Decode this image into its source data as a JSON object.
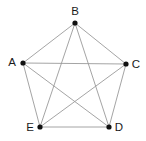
{
  "figure": {
    "type": "graph-diagram",
    "width": 146,
    "height": 141,
    "background_color": "#ffffff",
    "edge_color": "#9a9a9a",
    "vertex_color": "#111111",
    "label_color": "#1a1a1a"
  },
  "graph_data": {
    "type": "undirected-complete-graph",
    "name": "K5",
    "vertex_count": 5,
    "edge_count": 10,
    "vertices": [
      {
        "id": "A",
        "label": "A",
        "x": 23,
        "y": 63,
        "label_x": 12,
        "label_y": 63,
        "label_anchor": "middle"
      },
      {
        "id": "B",
        "label": "B",
        "x": 75,
        "y": 23,
        "label_x": 75,
        "label_y": 12,
        "label_anchor": "middle"
      },
      {
        "id": "C",
        "label": "C",
        "x": 126,
        "y": 64,
        "label_x": 136,
        "label_y": 65,
        "label_anchor": "middle"
      },
      {
        "id": "D",
        "label": "D",
        "x": 109,
        "y": 127,
        "label_x": 119,
        "label_y": 128,
        "label_anchor": "middle"
      },
      {
        "id": "E",
        "label": "E",
        "x": 40,
        "y": 127,
        "label_x": 30,
        "label_y": 128,
        "label_anchor": "middle"
      }
    ],
    "edges": [
      {
        "from": "A",
        "to": "B",
        "kind": "outer"
      },
      {
        "from": "B",
        "to": "C",
        "kind": "outer"
      },
      {
        "from": "C",
        "to": "D",
        "kind": "outer"
      },
      {
        "from": "D",
        "to": "E",
        "kind": "outer"
      },
      {
        "from": "E",
        "to": "A",
        "kind": "outer"
      },
      {
        "from": "A",
        "to": "C",
        "kind": "diagonal"
      },
      {
        "from": "A",
        "to": "D",
        "kind": "diagonal"
      },
      {
        "from": "B",
        "to": "D",
        "kind": "diagonal"
      },
      {
        "from": "B",
        "to": "E",
        "kind": "diagonal"
      },
      {
        "from": "C",
        "to": "E",
        "kind": "diagonal"
      }
    ],
    "vertex_radius": 2.6
  }
}
